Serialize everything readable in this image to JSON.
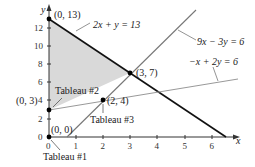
{
  "figure": {
    "x_axis_label": "x",
    "y_axis_label": "y",
    "x_ticks": [
      "0",
      "1",
      "2",
      "3",
      "4",
      "5",
      "6"
    ],
    "y_ticks": [
      "0",
      "2",
      "4",
      "6",
      "8",
      "10",
      "12"
    ],
    "lines": [
      {
        "equation": "2x + y = 13",
        "color": "#111111"
      },
      {
        "equation": "9x − 3y = 6",
        "color": "#777777"
      },
      {
        "equation": "−x + 2y = 6",
        "color": "#999999"
      }
    ],
    "points": [
      {
        "label": "(0, 13)"
      },
      {
        "label": "(3, 7)"
      },
      {
        "label": "(0, 3)"
      },
      {
        "label": "(2, 4)"
      },
      {
        "label": "(0, 0)"
      }
    ],
    "annotations": [
      {
        "label": "Tableau #1"
      },
      {
        "label": "Tableau #2"
      },
      {
        "label": "Tableau #3"
      }
    ],
    "feasible_region_color": "#d9d9d9"
  }
}
